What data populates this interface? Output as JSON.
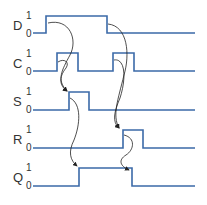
{
  "diagram": {
    "type": "timing-diagram",
    "colors": {
      "waveform": "#3b6aa8",
      "arrow": "#222222",
      "text": "#333333"
    },
    "signals": [
      {
        "name": "D",
        "high_label": "1",
        "low_label": "0",
        "transitions": [
          {
            "at": 46,
            "to": 1
          },
          {
            "at": 107,
            "to": 0
          }
        ]
      },
      {
        "name": "C",
        "high_label": "1",
        "low_label": "0",
        "transitions": [
          {
            "at": 57,
            "to": 1
          },
          {
            "at": 78,
            "to": 0
          },
          {
            "at": 113,
            "to": 1
          },
          {
            "at": 134,
            "to": 0
          }
        ]
      },
      {
        "name": "S",
        "high_label": "1",
        "low_label": "0",
        "transitions": [
          {
            "at": 69,
            "to": 1
          },
          {
            "at": 89,
            "to": 0
          }
        ]
      },
      {
        "name": "R",
        "high_label": "1",
        "low_label": "0",
        "transitions": [
          {
            "at": 123,
            "to": 1
          },
          {
            "at": 143,
            "to": 0
          }
        ]
      },
      {
        "name": "Q",
        "high_label": "1",
        "low_label": "0",
        "transitions": [
          {
            "at": 79,
            "to": 1
          },
          {
            "at": 132,
            "to": 0
          }
        ]
      }
    ],
    "causal_arrows": [
      {
        "from": "D rise",
        "to": "S rise"
      },
      {
        "from": "C rise 1",
        "to": "S rise"
      },
      {
        "from": "D fall",
        "to": "R rise"
      },
      {
        "from": "C rise 2",
        "to": "R rise"
      },
      {
        "from": "S rise",
        "to": "Q rise"
      },
      {
        "from": "R rise",
        "to": "Q fall"
      }
    ]
  }
}
